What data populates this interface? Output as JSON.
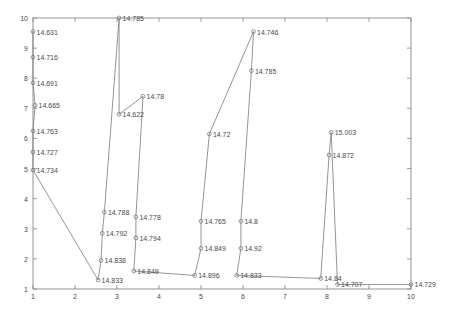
{
  "chart_data": {
    "type": "line",
    "title": "",
    "subtitle": "",
    "xlabel": "",
    "ylabel": "",
    "xlim": [
      1,
      10
    ],
    "ylim": [
      1,
      10
    ],
    "grid": false,
    "legend": null,
    "legend_position": "none",
    "marker": "circle",
    "line_color": "#7a7a7a",
    "marker_color": "#7a7a7a",
    "label_color": "#4a4a4a",
    "axis_color": "#888888",
    "background": "#ffffff",
    "xticks": [
      1,
      2,
      3,
      4,
      5,
      6,
      7,
      8,
      9,
      10
    ],
    "xtick_labels": [
      "1",
      "2",
      "3",
      "4",
      "5",
      "6",
      "7",
      "8",
      "9",
      "10"
    ],
    "yticks": [
      1,
      2,
      3,
      4,
      5,
      6,
      7,
      8,
      9,
      10
    ],
    "ytick_labels": [
      "1",
      "2",
      "3",
      "4",
      "5",
      "6",
      "7",
      "8",
      "9",
      "10"
    ],
    "points": [
      {
        "x": 1.0,
        "y": 9.55,
        "label": "14.631"
      },
      {
        "x": 1.0,
        "y": 8.7,
        "label": "14.716"
      },
      {
        "x": 1.0,
        "y": 7.85,
        "label": "14.691"
      },
      {
        "x": 1.05,
        "y": 7.1,
        "label": "14.665"
      },
      {
        "x": 1.0,
        "y": 6.25,
        "label": "14.763"
      },
      {
        "x": 1.0,
        "y": 5.55,
        "label": "14.727"
      },
      {
        "x": 1.0,
        "y": 4.95,
        "label": "14.734"
      },
      {
        "x": 2.55,
        "y": 1.3,
        "label": "14.833"
      },
      {
        "x": 2.7,
        "y": 3.55,
        "label": "14.788"
      },
      {
        "x": 2.65,
        "y": 2.85,
        "label": "14.792"
      },
      {
        "x": 2.62,
        "y": 1.95,
        "label": "14.838"
      },
      {
        "x": 3.05,
        "y": 10.0,
        "label": "14.785"
      },
      {
        "x": 3.05,
        "y": 6.8,
        "label": "14.622"
      },
      {
        "x": 3.62,
        "y": 7.4,
        "label": "14.78"
      },
      {
        "x": 3.45,
        "y": 3.4,
        "label": "14.778"
      },
      {
        "x": 3.45,
        "y": 2.7,
        "label": "14.794"
      },
      {
        "x": 3.4,
        "y": 1.6,
        "label": "14.849"
      },
      {
        "x": 4.85,
        "y": 1.45,
        "label": "14.896"
      },
      {
        "x": 5.0,
        "y": 3.25,
        "label": "14.765"
      },
      {
        "x": 5.0,
        "y": 2.35,
        "label": "14.849"
      },
      {
        "x": 5.2,
        "y": 6.15,
        "label": "14.72"
      },
      {
        "x": 5.85,
        "y": 1.45,
        "label": "14.833"
      },
      {
        "x": 5.95,
        "y": 3.25,
        "label": "14.8"
      },
      {
        "x": 5.95,
        "y": 2.35,
        "label": "14.92"
      },
      {
        "x": 6.25,
        "y": 9.55,
        "label": "14.746"
      },
      {
        "x": 6.2,
        "y": 8.25,
        "label": "14.785"
      },
      {
        "x": 7.85,
        "y": 1.35,
        "label": "14.84"
      },
      {
        "x": 8.1,
        "y": 6.2,
        "label": "15.003"
      },
      {
        "x": 8.05,
        "y": 5.45,
        "label": "14.872"
      },
      {
        "x": 8.25,
        "y": 1.15,
        "label": "14.707"
      },
      {
        "x": 10.0,
        "y": 1.15,
        "label": "14.729"
      }
    ],
    "path_order": [
      0,
      1,
      2,
      3,
      4,
      5,
      6,
      7,
      10,
      9,
      8,
      11,
      12,
      13,
      14,
      15,
      16,
      17,
      19,
      18,
      20,
      24,
      25,
      22,
      23,
      21,
      26,
      28,
      27,
      29,
      30
    ]
  }
}
